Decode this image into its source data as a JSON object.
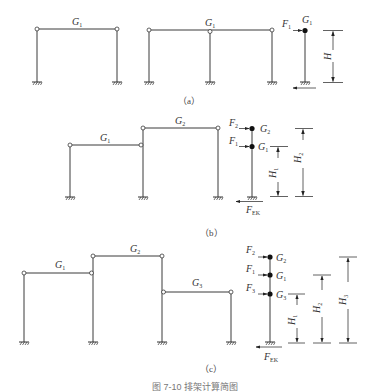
{
  "figure": {
    "caption": "图 7-10  排架计算简图",
    "panels": [
      {
        "id": "a",
        "label": "（a）",
        "frames": [
          {
            "beams": [
              {
                "mass": "G",
                "sub": "1"
              }
            ],
            "columns": 2
          },
          {
            "beams": [
              {
                "mass": "G",
                "sub": "1"
              }
            ],
            "columns": 3
          }
        ],
        "model": {
          "nodes": [
            {
              "mass": "G",
              "sub": "1",
              "force": "F",
              "force_sub": "1"
            }
          ],
          "base_shear": "",
          "dimensions": [
            {
              "symbol": "H",
              "sub": ""
            }
          ]
        }
      },
      {
        "id": "b",
        "label": "（b）",
        "frames": [
          {
            "beams": [
              {
                "mass": "G",
                "sub": "1"
              },
              {
                "mass": "G",
                "sub": "2"
              }
            ],
            "columns": 3
          }
        ],
        "model": {
          "nodes": [
            {
              "mass": "G",
              "sub": "2",
              "force": "F",
              "force_sub": "2"
            },
            {
              "mass": "G",
              "sub": "1",
              "force": "F",
              "force_sub": "1"
            }
          ],
          "base_shear": {
            "symbol": "F",
            "sub": "EK"
          },
          "dimensions": [
            {
              "symbol": "H",
              "sub": "1"
            },
            {
              "symbol": "H",
              "sub": "2"
            }
          ]
        }
      },
      {
        "id": "c",
        "label": "（c）",
        "frames": [
          {
            "beams": [
              {
                "mass": "G",
                "sub": "1"
              },
              {
                "mass": "G",
                "sub": "2"
              },
              {
                "mass": "G",
                "sub": "3"
              }
            ],
            "columns": 4
          }
        ],
        "model": {
          "nodes": [
            {
              "mass": "G",
              "sub": "2",
              "force": "F",
              "force_sub": "2"
            },
            {
              "mass": "G",
              "sub": "1",
              "force": "F",
              "force_sub": "1"
            },
            {
              "mass": "G",
              "sub": "3",
              "force": "F",
              "force_sub": "3"
            }
          ],
          "base_shear": {
            "symbol": "F",
            "sub": "EK"
          },
          "dimensions": [
            {
              "symbol": "H",
              "sub": "1"
            },
            {
              "symbol": "H",
              "sub": "2"
            },
            {
              "symbol": "H",
              "sub": "3"
            }
          ]
        }
      }
    ]
  }
}
